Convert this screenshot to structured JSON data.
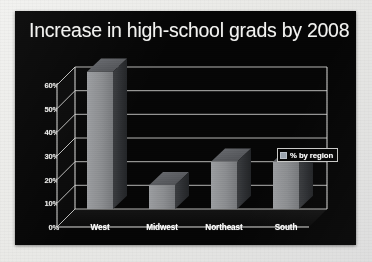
{
  "slide": {
    "background_color": "#050505",
    "page_background_color": "#e9e9e6"
  },
  "chart_data": {
    "type": "bar",
    "title": "Increase in high-school grads by 2008",
    "xlabel": "",
    "ylabel": "",
    "categories": [
      "West",
      "Midwest",
      "Northeast",
      "South"
    ],
    "values": [
      58,
      10,
      20,
      20
    ],
    "series": [
      {
        "name": "% by region",
        "values": [
          58,
          10,
          20,
          20
        ],
        "color": "#8d8f92"
      }
    ],
    "ylim": [
      0,
      60
    ],
    "ytick_values": [
      0,
      10,
      20,
      30,
      40,
      50,
      60
    ],
    "ytick_labels": [
      "0%",
      "10%",
      "20%",
      "30%",
      "40%",
      "50%",
      "60%"
    ],
    "grid": true,
    "three_d": true,
    "legend": {
      "position": "right",
      "entries": [
        "% by region"
      ],
      "swatch_color": "#9aa3ae"
    },
    "bar_colors": {
      "front": "#8d8f92",
      "top": "#5a5c60",
      "side": "#2e3033"
    },
    "axis_color": "#d8d8d6",
    "text_color": "#ffffff"
  }
}
